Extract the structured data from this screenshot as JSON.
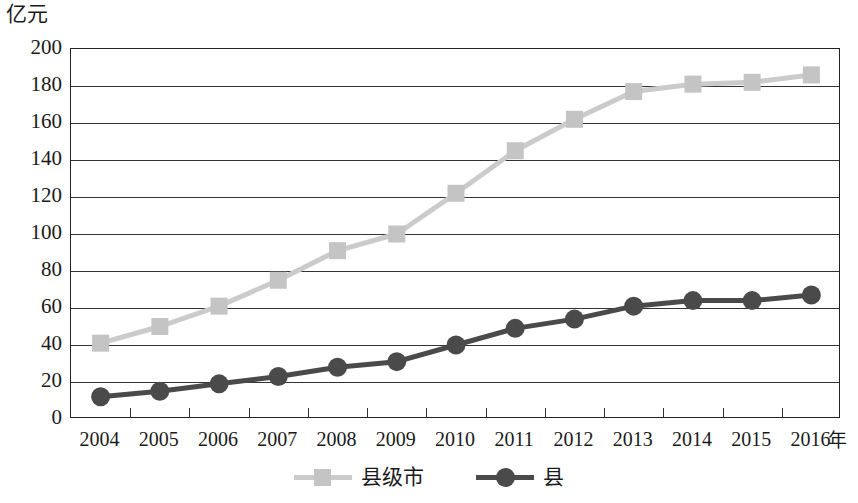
{
  "chart_data": {
    "type": "line",
    "title": "",
    "xlabel": "年",
    "ylabel": "亿元",
    "ylim": [
      0,
      200
    ],
    "ytick_step": 20,
    "grid": true,
    "legend_position": "bottom",
    "categories": [
      "2004",
      "2005",
      "2006",
      "2007",
      "2008",
      "2009",
      "2010",
      "2011",
      "2012",
      "2013",
      "2014",
      "2015",
      "2016"
    ],
    "yticks": [
      "200",
      "180",
      "160",
      "140",
      "120",
      "100",
      "80",
      "60",
      "40",
      "20",
      "0"
    ],
    "series": [
      {
        "name": "县级市",
        "marker": "square",
        "color": "#c4c4c4",
        "line_color": "#cbcbcb",
        "values": [
          41,
          50,
          61,
          75,
          91,
          100,
          122,
          145,
          162,
          177,
          181,
          182,
          186
        ]
      },
      {
        "name": "县",
        "marker": "circle",
        "color": "#4a4a4a",
        "line_color": "#4a4a4a",
        "values": [
          12,
          15,
          19,
          23,
          28,
          31,
          40,
          49,
          54,
          61,
          64,
          64,
          67
        ]
      }
    ]
  },
  "axis": {
    "unit_label": "亿元",
    "x_unit_label": "年"
  },
  "legend": {
    "items": [
      {
        "label": "县级市"
      },
      {
        "label": "县"
      }
    ]
  },
  "colors": {
    "series_light": "#c4c4c4",
    "series_light_line": "#cbcbcb",
    "series_dark": "#4a4a4a",
    "axis": "#222222",
    "grid": "#333333",
    "background": "#ffffff"
  }
}
